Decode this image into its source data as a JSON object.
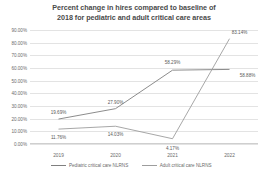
{
  "chart_data": {
    "type": "line",
    "title": "Percent change in hires compared to baseline of 2018 for pediatric and adult critical care areas",
    "title_line1": "Percent change in hires compared to baseline of",
    "title_line2": "2018 for pediatric and adult critical care areas",
    "xlabel": "",
    "ylabel": "",
    "categories": [
      "2019",
      "2020",
      "2021",
      "2022"
    ],
    "ylim": [
      0,
      90
    ],
    "ytick_values": [
      90,
      80,
      70,
      60,
      50,
      40,
      30,
      20,
      10,
      0
    ],
    "ytick_labels": [
      "90.00%",
      "80.00%",
      "70.00%",
      "60.00%",
      "50.00%",
      "40.00%",
      "30.00%",
      "20.00%",
      "10.00%",
      "0.00%"
    ],
    "grid": true,
    "legend_position": "bottom",
    "series": [
      {
        "name": "Pediatric critical care NLRNS",
        "color": "#7f7f7f",
        "values": [
          19.69,
          27.9,
          58.29,
          58.88
        ],
        "labels": [
          "19.69%",
          "27.90%",
          "58.29%",
          "58.88%"
        ]
      },
      {
        "name": "Adult critical care NLRNS",
        "color": "#9d9d9d",
        "values": [
          11.76,
          14.03,
          4.17,
          83.14
        ],
        "labels": [
          "11.76%",
          "14.03%",
          "4.17%",
          "83.14%"
        ]
      }
    ]
  },
  "colors": {
    "background": "#ffffff",
    "grid": "#e3e3e3",
    "text": "#6b6b6b",
    "title": "#4a4a4a"
  }
}
